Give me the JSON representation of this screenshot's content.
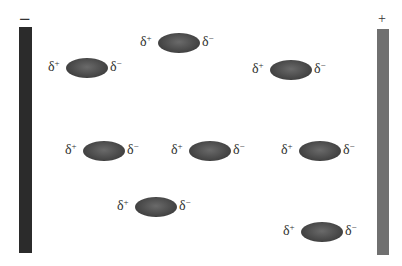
{
  "diagram": {
    "negative_plate": {
      "label": "−",
      "color": "#2b2b2b",
      "x": 19,
      "y": 27,
      "width": 13,
      "height": 226
    },
    "positive_plate": {
      "label": "+",
      "color": "#707070",
      "x": 377,
      "y": 29,
      "width": 12,
      "height": 226
    },
    "molecule_color": "#4a4a4a",
    "partial_positive": "δ",
    "partial_positive_sign": "+",
    "partial_negative": "δ",
    "partial_negative_sign": "−",
    "molecules": [
      {
        "cx": 179,
        "cy": 43
      },
      {
        "cx": 87,
        "cy": 68
      },
      {
        "cx": 291,
        "cy": 70
      },
      {
        "cx": 104,
        "cy": 151
      },
      {
        "cx": 210,
        "cy": 151
      },
      {
        "cx": 320,
        "cy": 151
      },
      {
        "cx": 156,
        "cy": 207
      },
      {
        "cx": 322,
        "cy": 232
      }
    ]
  }
}
